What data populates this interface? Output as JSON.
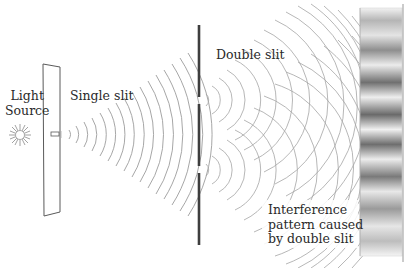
{
  "diagram": {
    "labels": {
      "light_source_line1": "Light",
      "light_source_line2": "Source",
      "single_slit": "Single slit",
      "double_slit": "Double slit",
      "interference_line1": "Interference",
      "interference_line2": "pattern caused",
      "interference_line3": "by double slit"
    },
    "components": [
      {
        "name": "light-source",
        "x": 20,
        "y": 135
      },
      {
        "name": "single-slit-barrier",
        "x": 43,
        "y": 65,
        "slit_y": 134
      },
      {
        "name": "double-slit-barrier",
        "x": 199,
        "y_top": 25,
        "y_bottom": 245,
        "slit_y": [
          100,
          170
        ]
      },
      {
        "name": "screen",
        "x": 360,
        "width": 42,
        "fringes": 9
      }
    ],
    "colors": {
      "ink": "#2a2a2a",
      "wave": "#9a9a9a",
      "screen_dark": "#6a6a6a",
      "screen_light": "#e6e6e6"
    }
  }
}
